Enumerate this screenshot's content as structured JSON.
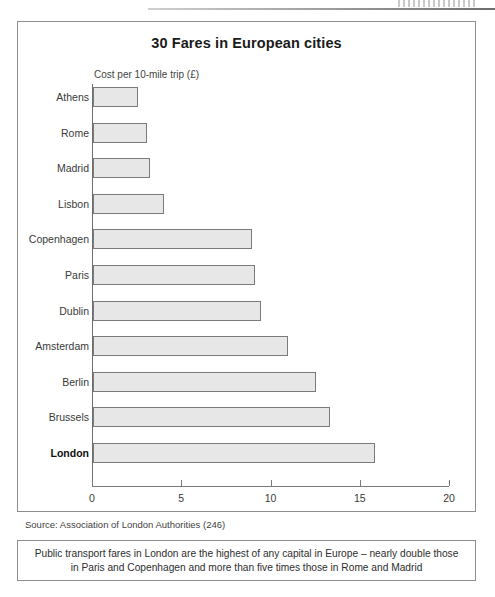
{
  "page": {
    "header_rule": "scanned-page-header-rule"
  },
  "figure": {
    "title": "30 Fares in European cities",
    "axis_caption": "Cost per 10-mile trip (£)",
    "source": "Source: Association of London Authorities (246)",
    "caption_line1": "Public transport fares in London are the highest of any capital in Europe – nearly double those",
    "caption_line2": "in Paris and Copenhagen and more than five times those in Rome and Madrid"
  },
  "chart_data": {
    "type": "bar",
    "orientation": "horizontal",
    "title": "30 Fares in European cities",
    "xlabel": "Cost per 10-mile trip (£)",
    "ylabel": "",
    "xlim": [
      0,
      20
    ],
    "ticks": [
      "0",
      "5",
      "10",
      "15",
      "20"
    ],
    "tick_values": [
      0,
      5,
      10,
      15,
      20
    ],
    "grid": false,
    "legend": null,
    "highlight": "London",
    "categories": [
      "Athens",
      "Rome",
      "Madrid",
      "Lisbon",
      "Copenhagen",
      "Paris",
      "Dublin",
      "Amsterdam",
      "Berlin",
      "Brussels",
      "London"
    ],
    "values": [
      2.5,
      3.0,
      3.2,
      4.0,
      8.9,
      9.1,
      9.4,
      10.9,
      12.5,
      13.3,
      15.8
    ],
    "bars": [
      {
        "label": "Athens",
        "value": 2.5,
        "emphasis": false
      },
      {
        "label": "Rome",
        "value": 3.0,
        "emphasis": false
      },
      {
        "label": "Madrid",
        "value": 3.2,
        "emphasis": false
      },
      {
        "label": "Lisbon",
        "value": 4.0,
        "emphasis": false
      },
      {
        "label": "Copenhagen",
        "value": 8.9,
        "emphasis": false
      },
      {
        "label": "Paris",
        "value": 9.1,
        "emphasis": false
      },
      {
        "label": "Dublin",
        "value": 9.4,
        "emphasis": false
      },
      {
        "label": "Amsterdam",
        "value": 10.9,
        "emphasis": false
      },
      {
        "label": "Berlin",
        "value": 12.5,
        "emphasis": false
      },
      {
        "label": "Brussels",
        "value": 13.3,
        "emphasis": false
      },
      {
        "label": "London",
        "value": 15.8,
        "emphasis": true
      }
    ],
    "colors": {
      "bar_fill": "#e7e7e7",
      "bar_stroke": "#7b7b7b",
      "axis": "#7a7a7a",
      "text": "#2b2b2b"
    }
  }
}
